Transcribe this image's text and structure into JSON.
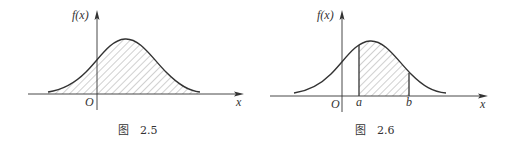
{
  "figures": [
    {
      "id": "fig-2-5",
      "caption_prefix": "图",
      "caption_number": "2.5",
      "y_axis_label": "f(x)",
      "x_axis_label": "x",
      "origin_label": "O",
      "shading": "entire area under curve"
    },
    {
      "id": "fig-2-6",
      "caption_prefix": "图",
      "caption_number": "2.6",
      "y_axis_label": "f(x)",
      "x_axis_label": "x",
      "origin_label": "O",
      "bound_a_label": "a",
      "bound_b_label": "b",
      "shading": "area under curve between a and b"
    }
  ],
  "colors": {
    "ink": "#333333",
    "hatch": "#8a8a8a",
    "background": "#ffffff"
  }
}
